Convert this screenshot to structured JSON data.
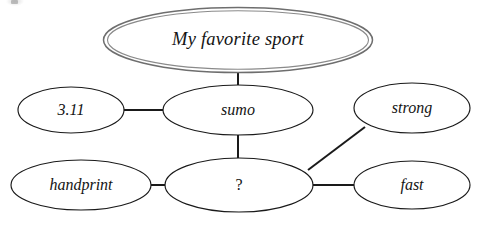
{
  "diagram": {
    "type": "concept-map",
    "title_node": "My favorite sport",
    "background_color": "#ffffff",
    "line_color": "#1a1a1a",
    "root_border_color": "#6e6e6e",
    "nodes": [
      {
        "id": "root",
        "label": "My favorite sport",
        "cx": 238,
        "cy": 40,
        "rx": 134,
        "ry": 32,
        "style": "double"
      },
      {
        "id": "version",
        "label": "3.11",
        "cx": 71,
        "cy": 110,
        "rx": 53,
        "ry": 23,
        "style": "single"
      },
      {
        "id": "sumo",
        "label": "sumo",
        "cx": 238,
        "cy": 110,
        "rx": 75,
        "ry": 25,
        "style": "single"
      },
      {
        "id": "strong",
        "label": "strong",
        "cx": 412,
        "cy": 108,
        "rx": 58,
        "ry": 25,
        "style": "single"
      },
      {
        "id": "handprint",
        "label": "handprint",
        "cx": 81,
        "cy": 185,
        "rx": 70,
        "ry": 25,
        "style": "single"
      },
      {
        "id": "query",
        "label": "?",
        "cx": 239,
        "cy": 185,
        "rx": 74,
        "ry": 27,
        "style": "single"
      },
      {
        "id": "fast",
        "label": "fast",
        "cx": 412,
        "cy": 185,
        "rx": 58,
        "ry": 24,
        "style": "single"
      }
    ],
    "edges": [
      {
        "id": "edge-root-sumo",
        "from": "root",
        "to": "sumo",
        "x1": 238,
        "y1": 72,
        "x2": 238,
        "y2": 85
      },
      {
        "id": "edge-version-sumo",
        "from": "version",
        "to": "sumo",
        "x1": 124,
        "y1": 110,
        "x2": 164,
        "y2": 110
      },
      {
        "id": "edge-sumo-query",
        "from": "sumo",
        "to": "query",
        "x1": 238,
        "y1": 135,
        "x2": 238,
        "y2": 158
      },
      {
        "id": "edge-handprint-query",
        "from": "handprint",
        "to": "query",
        "x1": 151,
        "y1": 185,
        "x2": 165,
        "y2": 185
      },
      {
        "id": "edge-query-fast",
        "from": "query",
        "to": "fast",
        "x1": 313,
        "y1": 185,
        "x2": 355,
        "y2": 185
      },
      {
        "id": "edge-query-strong",
        "from": "query",
        "to": "strong",
        "x1": 309,
        "y1": 169,
        "x2": 364,
        "y2": 127
      }
    ]
  }
}
